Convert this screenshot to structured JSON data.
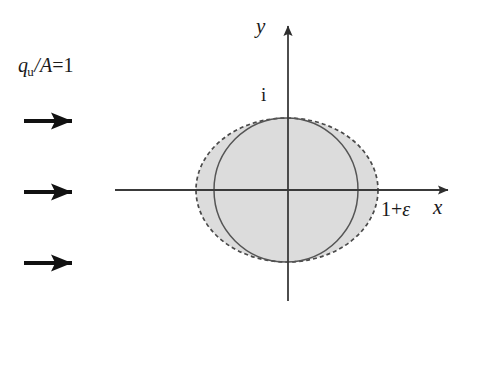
{
  "figure": {
    "background_color": "#ffffff",
    "width": 490,
    "height": 367
  },
  "labels": {
    "flow_symbol": "q",
    "flow_subscript": "u",
    "flow_slash": "/",
    "flow_area": "A",
    "flow_equals": "=",
    "flow_value": "1",
    "flow_full": "q_u/A=1",
    "y_axis": "y",
    "x_axis": "x",
    "top_tick": "i",
    "right_tick": "1+",
    "right_tick_symbol": "ε",
    "right_tick_full": "1+ε"
  },
  "axes": {
    "origin": {
      "x": 288,
      "y": 190
    },
    "x_axis_start": {
      "x": 115,
      "y": 190
    },
    "x_axis_end": {
      "x": 455,
      "y": 190
    },
    "y_axis_top": {
      "x": 288,
      "y": 18
    },
    "y_axis_bottom": {
      "x": 288,
      "y": 301
    },
    "line_color": "#3a3a3a",
    "line_width": 1.8,
    "arrow_head": "solid-triangle"
  },
  "shapes": {
    "ellipse": {
      "name": "distorted-cylinder-boundary",
      "cx": 287,
      "cy": 190,
      "rx": 91,
      "ry": 72,
      "stroke": "#4a4a4a",
      "stroke_dasharray": "4 3",
      "fill": "#dcdcdc",
      "description": "dashed outer ellipse, radius 1+epsilon along x"
    },
    "circle": {
      "name": "unit-circle",
      "cx": 286,
      "cy": 190,
      "r": 72,
      "stroke": "#555555",
      "fill": "none",
      "description": "solid inscribed unit circle, radius 1"
    }
  },
  "flow_arrows": {
    "name": "uniform-flow-arrows",
    "color": "#111111",
    "shaft_width": 4,
    "count": 3,
    "items": [
      {
        "y": 121,
        "x_start": 24,
        "x_tip": 90
      },
      {
        "y": 192,
        "x_start": 24,
        "x_tip": 90
      },
      {
        "y": 263,
        "x_start": 24,
        "x_tip": 90
      }
    ]
  }
}
